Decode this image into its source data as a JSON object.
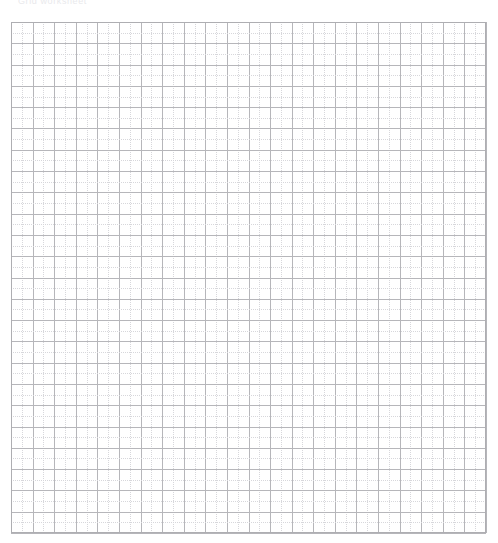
{
  "page": {
    "width": 498,
    "height": 543,
    "background_color": "#ffffff"
  },
  "header": {
    "caption": "Grid worksheet",
    "color": "#e9e9ec",
    "clipped": "true"
  },
  "grid": {
    "label": "graph-paper-grid",
    "x": 11,
    "y": 22,
    "width": 475,
    "height": 511,
    "major_columns": 22,
    "major_rows": 24,
    "major_cell_width": 21.6,
    "major_cell_height": 21.3,
    "minor_subdivisions": 2,
    "major_line_color": "#b6b6ba",
    "minor_line_color": "#d7d7db",
    "border_color": "#aeaeb2",
    "cell_fill_color": "#ffffff"
  }
}
